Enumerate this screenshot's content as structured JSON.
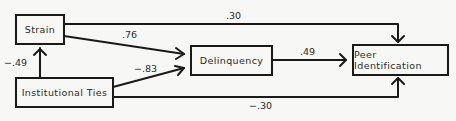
{
  "nodes": {
    "strain": "Strain",
    "institutional_ties": "Institutional Ties",
    "delinquency": "Delinquency",
    "peer_identification": "Peer Identification"
  },
  "edges": [
    {
      "from": "Strain",
      "to": "Peer Identification",
      "coefficient": ".30"
    },
    {
      "from": "Strain",
      "to": "Delinquency",
      "coefficient": ".76"
    },
    {
      "from": "Institutional Ties",
      "to": "Strain",
      "coefficient": "−.49"
    },
    {
      "from": "Institutional Ties",
      "to": "Delinquency",
      "coefficient": "−.83"
    },
    {
      "from": "Delinquency",
      "to": "Peer Identification",
      "coefficient": ".49"
    },
    {
      "from": "Institutional Ties",
      "to": "Peer Identification",
      "coefficient": "−.30"
    }
  ],
  "colors": {
    "line": "#1a1a1a",
    "background": "#f7f7f5"
  }
}
